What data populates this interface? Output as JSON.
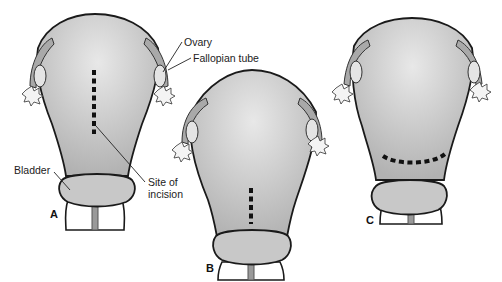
{
  "figure": {
    "panels": [
      {
        "id": "A",
        "label": "A",
        "incision": "classic vertical (fundal/body)"
      },
      {
        "id": "B",
        "label": "B",
        "incision": "low vertical"
      },
      {
        "id": "C",
        "label": "C",
        "incision": "low transverse"
      }
    ],
    "labels": {
      "ovary": "Ovary",
      "fallopian_tube": "Fallopian tube",
      "bladder": "Bladder",
      "site_of_incision_line1": "Site of",
      "site_of_incision_line2": "incision"
    },
    "colors": {
      "background": "#ffffff",
      "uterus_light": "#e6e6e6",
      "uterus_dark": "#b4b4b4",
      "outline": "#1a1a1a",
      "bladder": "#c8c8c8",
      "incision": "#111111"
    }
  }
}
